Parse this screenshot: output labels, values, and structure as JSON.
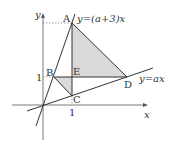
{
  "diagram": {
    "type": "coordinate-geometry",
    "axes": {
      "x_label": "x",
      "y_label": "y",
      "tick_x": "1",
      "tick_y": "1"
    },
    "lines": [
      {
        "name": "line-steep",
        "label": "y=(a+3)x"
      },
      {
        "name": "line-shallow",
        "label": "y=ax"
      }
    ],
    "points": {
      "A": "A",
      "B": "B",
      "C": "C",
      "D": "D",
      "E": "E"
    },
    "shaded_regions": [
      "triangle AED",
      "triangle BEC"
    ],
    "colors": {
      "shade": "#d9d9d9",
      "line": "#333333",
      "dashed": "#666666"
    }
  }
}
